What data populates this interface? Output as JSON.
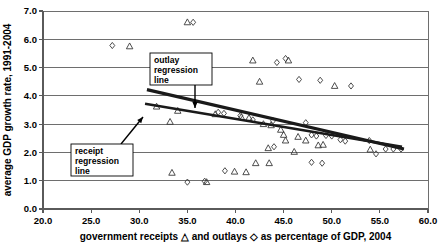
{
  "chart_data": {
    "type": "scatter",
    "title": "",
    "xlabel": "government receipts △ and outlays ◇ as percentage of GDP, 2004",
    "ylabel": "average GDP growth rate, 1991-2004",
    "xlim": [
      20.0,
      60.0
    ],
    "ylim": [
      0.0,
      7.0
    ],
    "xticks": [
      "20.0",
      "25.0",
      "30.0",
      "35.0",
      "40.0",
      "45.0",
      "50.0",
      "55.0",
      "60.0"
    ],
    "yticks": [
      "0.0",
      "1.0",
      "2.0",
      "3.0",
      "4.0",
      "5.0",
      "6.0",
      "7.0"
    ],
    "xtick_values": [
      20.0,
      25.0,
      30.0,
      35.0,
      40.0,
      45.0,
      50.0,
      55.0,
      60.0
    ],
    "ytick_values": [
      0.0,
      1.0,
      2.0,
      3.0,
      4.0,
      5.0,
      6.0,
      7.0
    ],
    "grid": "horizontal",
    "legend_position": "in-axis-label",
    "series": [
      {
        "name": "government receipts",
        "marker": "triangle",
        "legend_glyph": "△",
        "points": [
          [
            29.0,
            5.75
          ],
          [
            35.0,
            6.6
          ],
          [
            41.8,
            5.25
          ],
          [
            45.5,
            5.25
          ],
          [
            42.5,
            4.5
          ],
          [
            50.3,
            4.35
          ],
          [
            31.8,
            3.62
          ],
          [
            34.0,
            3.47
          ],
          [
            33.2,
            3.08
          ],
          [
            37.9,
            3.35
          ],
          [
            40.6,
            3.25
          ],
          [
            41.4,
            3.22
          ],
          [
            42.9,
            3.0
          ],
          [
            43.7,
            2.96
          ],
          [
            44.7,
            2.8
          ],
          [
            45.0,
            2.62
          ],
          [
            45.2,
            2.42
          ],
          [
            46.5,
            2.55
          ],
          [
            47.3,
            2.42
          ],
          [
            48.6,
            2.25
          ],
          [
            49.1,
            2.27
          ],
          [
            43.4,
            2.15
          ],
          [
            46.1,
            2.02
          ],
          [
            54.0,
            2.1
          ],
          [
            42.1,
            1.62
          ],
          [
            43.5,
            1.62
          ],
          [
            33.4,
            1.28
          ],
          [
            37.0,
            0.95
          ],
          [
            39.9,
            1.32
          ],
          [
            41.1,
            1.3
          ]
        ]
      },
      {
        "name": "government outlays",
        "marker": "diamond",
        "legend_glyph": "◇",
        "points": [
          [
            27.2,
            5.78
          ],
          [
            35.6,
            6.6
          ],
          [
            44.3,
            5.18
          ],
          [
            45.2,
            5.32
          ],
          [
            48.8,
            4.55
          ],
          [
            52.0,
            4.35
          ],
          [
            46.6,
            4.58
          ],
          [
            38.2,
            3.42
          ],
          [
            38.8,
            3.38
          ],
          [
            40.5,
            3.3
          ],
          [
            41.8,
            3.15
          ],
          [
            43.9,
            3.12
          ],
          [
            47.3,
            3.05
          ],
          [
            49.4,
            2.6
          ],
          [
            50.0,
            2.58
          ],
          [
            50.9,
            2.45
          ],
          [
            51.4,
            2.4
          ],
          [
            44.0,
            2.2
          ],
          [
            47.9,
            2.62
          ],
          [
            48.4,
            2.58
          ],
          [
            53.9,
            2.42
          ],
          [
            55.6,
            2.12
          ],
          [
            56.4,
            2.12
          ],
          [
            57.2,
            2.12
          ],
          [
            54.6,
            1.95
          ],
          [
            47.9,
            1.65
          ],
          [
            49.0,
            1.62
          ],
          [
            38.9,
            1.35
          ],
          [
            36.8,
            0.98
          ],
          [
            35.0,
            0.95
          ]
        ]
      }
    ],
    "trendlines": [
      {
        "name": "outlay regression line",
        "label": "outlay\nregression\nline",
        "x0": 30.8,
        "y0": 4.22,
        "x1": 57.5,
        "y1": 2.12
      },
      {
        "name": "receipt regression line",
        "label": "receipt\nregression\nline",
        "x0": 30.6,
        "y0": 3.72,
        "x1": 57.3,
        "y1": 2.2
      }
    ],
    "annotations": [
      {
        "name": "outlay-regression-callout",
        "lines": [
          "outlay",
          "regression",
          "line"
        ],
        "box": {
          "x": 150,
          "y": 53,
          "w": 62,
          "h": 32
        },
        "arrow": {
          "x1": 195,
          "y1": 85,
          "x2": 195,
          "y2": 108
        }
      },
      {
        "name": "receipt-regression-callout",
        "lines": [
          "receipt",
          "regression",
          "line"
        ],
        "box": {
          "x": 71,
          "y": 144,
          "w": 62,
          "h": 32
        },
        "arrow": {
          "x1": 121,
          "y1": 144,
          "x2": 143,
          "y2": 117
        }
      }
    ],
    "colors": {
      "marker_stroke": "#3a3a3a",
      "gridline": "#6e6e6e",
      "axis": "#5a5a5a",
      "trendline": "#1a1a1a",
      "background": "#ffffff"
    }
  },
  "axis_label_parts": {
    "x_prefix": "government receipts ",
    "x_tri_glyph": "△",
    "x_middle": " and outlays ",
    "x_dia_glyph": "◇",
    "x_suffix": " as percentage of GDP, 2004"
  }
}
